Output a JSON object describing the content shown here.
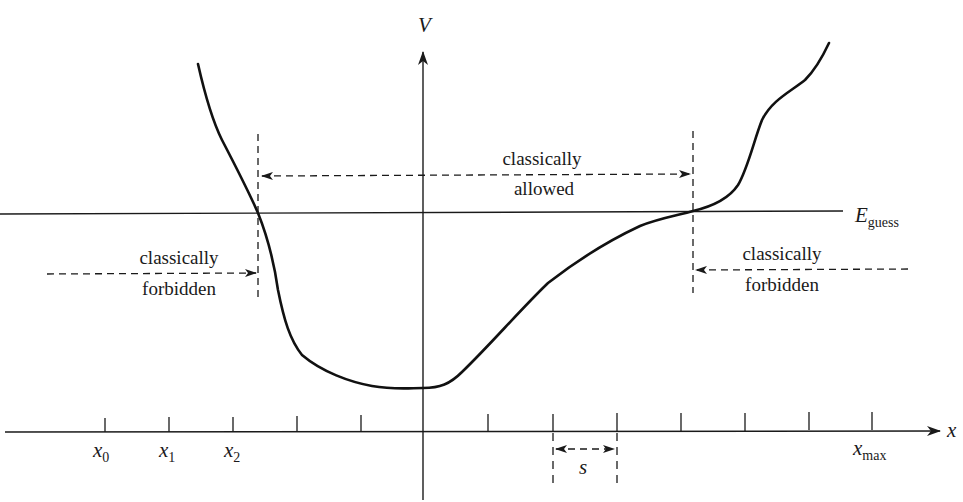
{
  "figure": {
    "axes": {
      "y_label": "V",
      "x_label": "x"
    },
    "energy_line": {
      "label_main": "E",
      "label_sub": "guess"
    },
    "x_ticks": [
      {
        "label_main": "x",
        "label_sub": "0"
      },
      {
        "label_main": "x",
        "label_sub": "1"
      },
      {
        "label_main": "x",
        "label_sub": "2"
      },
      {
        "label_main": "x",
        "label_sub": "max"
      }
    ],
    "step_label": "s",
    "regions": {
      "allowed": {
        "line1": "classically",
        "line2": "allowed"
      },
      "forbidden_left": {
        "line1": "classically",
        "line2": "forbidden"
      },
      "forbidden_right": {
        "line1": "classically",
        "line2": "forbidden"
      }
    }
  },
  "colors": {
    "ink": "#1a1a1a",
    "background": "#ffffff"
  }
}
